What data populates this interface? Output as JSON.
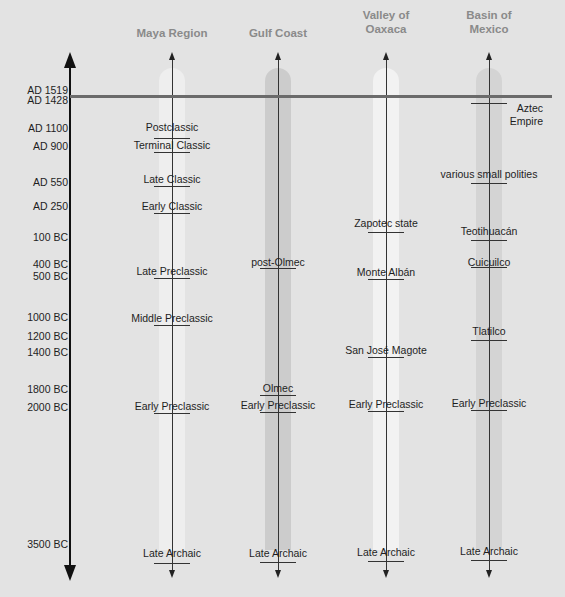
{
  "chart_data": {
    "type": "timeline",
    "title": "",
    "regions": [
      "Maya Region",
      "Gulf Coast",
      "Valley of Oaxaca",
      "Basin of Mexico"
    ],
    "time_axis": [
      "AD 1519",
      "AD 1428",
      "AD 1100",
      "AD 900",
      "AD 550",
      "AD 250",
      "100 BC",
      "400 BC",
      "500 BC",
      "1000 BC",
      "1200 BC",
      "1400 BC",
      "1800 BC",
      "2000 BC",
      "3500 BC"
    ],
    "reference_line": "AD 1519",
    "periods": {
      "Maya Region": [
        "Postclassic",
        "Terminal Classic",
        "Late Classic",
        "Early Classic",
        "Late Preclassic",
        "Middle Preclassic",
        "Early Preclassic",
        "Late Archaic"
      ],
      "Gulf Coast": [
        "post-Olmec",
        "Olmec",
        "Early Preclassic",
        "Late Archaic"
      ],
      "Valley of Oaxaca": [
        "Zapotec state",
        "Monte Albán",
        "San José Magote",
        "Early Preclassic",
        "Late Archaic"
      ],
      "Basin of Mexico": [
        "Aztec Empire",
        "various small polities",
        "Teotihuacán",
        "Cuicuilco",
        "Tlatilco",
        "Early Preclassic",
        "Late Archaic"
      ]
    }
  },
  "columns": [
    {
      "title": "Maya Region",
      "x": 172,
      "band_color": "#eeeeee",
      "items": [
        {
          "label": "Postclassic",
          "y": 125,
          "tick": 138
        },
        {
          "label": "Terminal Classic",
          "y": 143,
          "tick": 152
        },
        {
          "label": "Late Classic",
          "y": 177,
          "tick": 186
        },
        {
          "label": "Early Classic",
          "y": 204,
          "tick": 213
        },
        {
          "label": "Late Preclassic",
          "y": 269,
          "tick": 278
        },
        {
          "label": "Middle Preclassic",
          "y": 316,
          "tick": 325
        },
        {
          "label": "Early Preclassic",
          "y": 404,
          "tick": 413
        },
        {
          "label": "Late Archaic",
          "y": 551,
          "tick": 563
        }
      ]
    },
    {
      "title": "Gulf Coast",
      "x": 278,
      "band_color": "#cccccc",
      "items": [
        {
          "label": "post-Olmec",
          "y": 260,
          "tick": 268
        },
        {
          "label": "Olmec",
          "y": 386,
          "tick": 395
        },
        {
          "label": "Early Preclassic",
          "y": 403,
          "tick": 412
        },
        {
          "label": "Late Archaic",
          "y": 551,
          "tick": 562
        }
      ]
    },
    {
      "title": "Valley of Oaxaca",
      "x": 386,
      "band_color": "#f2f2f2",
      "items": [
        {
          "label": "Zapotec state",
          "y": 221,
          "tick": 232
        },
        {
          "label": "Monte Albán",
          "y": 270,
          "tick": 279
        },
        {
          "label": "San José Magote",
          "y": 348,
          "tick": 357
        },
        {
          "label": "Early Preclassic",
          "y": 402,
          "tick": 411
        },
        {
          "label": "Late Archaic",
          "y": 550,
          "tick": 561
        }
      ]
    },
    {
      "title": "Basin of Mexico",
      "x": 489,
      "band_color": "#d4d4d4",
      "items": [
        {
          "label": "Aztec Empire",
          "y": 102,
          "tick": 103
        },
        {
          "label": "various small polities",
          "y": 172,
          "tick": 183
        },
        {
          "label": "Teotihuacán",
          "y": 229,
          "tick": 240
        },
        {
          "label": "Cuicuilco",
          "y": 260,
          "tick": 267
        },
        {
          "label": "Tlatilco",
          "y": 329,
          "tick": 340
        },
        {
          "label": "Early Preclassic",
          "y": 401,
          "tick": 410
        },
        {
          "label": "Late Archaic",
          "y": 549,
          "tick": 560
        }
      ]
    }
  ],
  "y_labels": [
    {
      "label": "AD 1519",
      "y": 90
    },
    {
      "label": "AD 1428",
      "y": 100
    },
    {
      "label": "AD 1100",
      "y": 128
    },
    {
      "label": "AD 900",
      "y": 146
    },
    {
      "label": "AD 550",
      "y": 182
    },
    {
      "label": "AD 250",
      "y": 206
    },
    {
      "label": "100 BC",
      "y": 237
    },
    {
      "label": "400 BC",
      "y": 264
    },
    {
      "label": "500 BC",
      "y": 276
    },
    {
      "label": "1000 BC",
      "y": 317
    },
    {
      "label": "1200 BC",
      "y": 336
    },
    {
      "label": "1400 BC",
      "y": 352
    },
    {
      "label": "1800 BC",
      "y": 389
    },
    {
      "label": "2000 BC",
      "y": 407
    },
    {
      "label": "3500 BC",
      "y": 544
    }
  ]
}
